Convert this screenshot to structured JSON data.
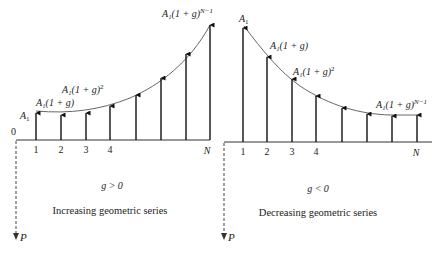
{
  "left_panel": {
    "condition": "g > 0",
    "caption": "Increasing geometric series",
    "origin_label": "0",
    "pv_label": "P",
    "tick_labels": [
      {
        "text": "1",
        "x": 36
      },
      {
        "text": "2",
        "x": 61
      },
      {
        "text": "3",
        "x": 86
      },
      {
        "text": "4",
        "x": 110
      },
      {
        "text": "N",
        "x": 207
      }
    ],
    "arrows": [
      {
        "x": 36,
        "tip": 113
      },
      {
        "x": 61,
        "tip": 115
      },
      {
        "x": 86,
        "tip": 113
      },
      {
        "x": 110,
        "tip": 106
      },
      {
        "x": 136,
        "tip": 95
      },
      {
        "x": 161,
        "tip": 78
      },
      {
        "x": 186,
        "tip": 54
      },
      {
        "x": 210,
        "tip": 25
      }
    ],
    "curve_labels": {
      "first": "A",
      "first_sub": "1",
      "second": "A₁(1 + g)",
      "third_base": "A₁(1 + g)",
      "third_exp": "2",
      "last_base": "A₁(1 + g)",
      "last_exp": "N−1"
    }
  },
  "right_panel": {
    "condition": "g < 0",
    "caption": "Decreasing geometric series",
    "pv_label": "P",
    "tick_labels": [
      {
        "text": "1",
        "x": 243
      },
      {
        "text": "2",
        "x": 267
      },
      {
        "text": "3",
        "x": 292
      },
      {
        "text": "4",
        "x": 316
      },
      {
        "text": "N",
        "x": 416
      }
    ],
    "arrows": [
      {
        "x": 243,
        "tip": 28
      },
      {
        "x": 267,
        "tip": 57
      },
      {
        "x": 292,
        "tip": 79
      },
      {
        "x": 316,
        "tip": 96
      },
      {
        "x": 342,
        "tip": 108
      },
      {
        "x": 367,
        "tip": 114
      },
      {
        "x": 392,
        "tip": 116
      },
      {
        "x": 417,
        "tip": 115
      }
    ],
    "curve_labels": {
      "first": "A",
      "first_sub": "1",
      "second": "A₁(1 + g)",
      "third_base": "A₁(1 + g)",
      "third_exp": "2",
      "last_base": "A₁(1 + g)",
      "last_exp": "N−1"
    }
  },
  "colors": {
    "ink": "#222222",
    "curve": "#555555",
    "background": "#ffffff"
  }
}
